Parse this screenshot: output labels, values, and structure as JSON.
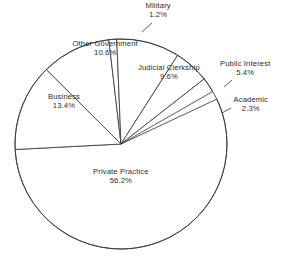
{
  "chart_data": {
    "type": "pie",
    "title": "",
    "subtitle": "",
    "xlabel": "",
    "ylabel": "",
    "legend_position": "none",
    "grid": false,
    "value_unit": "%",
    "categories": [
      "Private Practice",
      "Business",
      "Other Government",
      "Military",
      "Judicial Clerkship",
      "Public Interest",
      "Academic"
    ],
    "values": [
      56.2,
      13.4,
      10.6,
      1.2,
      9.6,
      5.4,
      2.3
    ],
    "slices": [
      {
        "label": "Private Practice",
        "value": 56.2,
        "value_text": "56.2%",
        "label_x": 121,
        "label_y": 176,
        "start_angle": 183.0,
        "end_angle": 385.3
      },
      {
        "label": "Business",
        "value": 13.4,
        "value_text": "13.4%",
        "label_x": 64,
        "label_y": 101,
        "start_angle": 134.8,
        "end_angle": 183.0
      },
      {
        "label": "Other Government",
        "value": 10.6,
        "value_text": "10.6%",
        "label_x": 105,
        "label_y": 48,
        "start_angle": 96.6,
        "end_angle": 134.8
      },
      {
        "label": "Military",
        "value": 1.2,
        "value_text": "1.2%",
        "label_x": 158,
        "label_y": 10,
        "start_angle": 92.3,
        "end_angle": 96.6
      },
      {
        "label": "Judicial Clerkship",
        "value": 9.6,
        "value_text": "9.6%",
        "label_x": 169,
        "label_y": 72,
        "start_angle": 57.7,
        "end_angle": 92.3
      },
      {
        "label": "Public Interest",
        "value": 5.4,
        "value_text": "5.4%",
        "label_x": 245,
        "label_y": 68,
        "start_angle": 38.3,
        "end_angle": 57.7
      },
      {
        "label": "Academic",
        "value": 2.3,
        "value_text": "2.3%",
        "label_x": 251,
        "label_y": 104,
        "start_angle": 30.0,
        "end_angle": 38.3
      }
    ],
    "geometry": {
      "center_x": 121,
      "center_y": 144,
      "radius_x": 106,
      "radius_y": 105
    },
    "colors": {
      "slice_fill": "#ffffff",
      "slice_stroke": "#3a3a3a",
      "label_text": "#2b2b2b",
      "background": "#ffffff"
    }
  }
}
